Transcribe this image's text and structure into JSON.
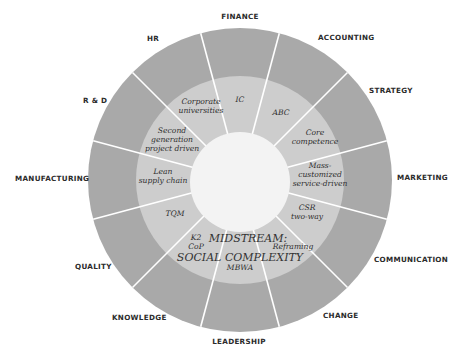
{
  "diagram": {
    "colors": {
      "outer_ring": "#a9a9a9",
      "middle_ring": "#cdcdcd",
      "center": "#f3f3f3",
      "divider": "#ffffff",
      "label": "#2b2b2b"
    },
    "center_title_line1": "MIDSTREAM:",
    "center_title_line2": "SOCIAL COMPLEXITY",
    "outer_labels": {
      "finance": "FINANCE",
      "accounting": "ACCOUNTING",
      "strategy": "STRATEGY",
      "marketing": "MARKETING",
      "communication": "COMMUNICATION",
      "change": "CHANGE",
      "leadership": "LEADERSHIP",
      "knowledge": "KNOWLEDGE",
      "quality": "QUALITY",
      "manufacturing": "MANUFACTURING",
      "rd": "R & D",
      "hr": "HR"
    },
    "inner_labels": {
      "ic": "IC",
      "abc": "ABC",
      "core_1": "Core",
      "core_2": "competence",
      "mass_1": "Mass-",
      "mass_2": "customized",
      "mass_3": "service-driven",
      "csr_1": "CSR",
      "csr_2": "two-way",
      "reframing": "Reframing",
      "mbwa": "MBWA",
      "k2": "K2",
      "cop": "CoP",
      "tqm": "TQM",
      "lean_1": "Lean",
      "lean_2": "supply chain",
      "second_1": "Second",
      "second_2": "generation",
      "second_3": "project driven",
      "corp_1": "Corporate",
      "corp_2": "universities"
    }
  }
}
